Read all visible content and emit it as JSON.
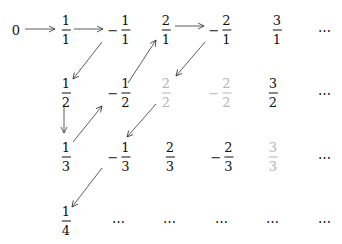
{
  "diagram": {
    "colors": {
      "text": "#111111",
      "duplicate": "#b5b5b5",
      "arrow": "#333333"
    },
    "nodes": [
      {
        "id": "zero",
        "type": "plain",
        "text": "0",
        "x": 16,
        "y": 30
      },
      {
        "id": "r0c1",
        "type": "frac",
        "sign": "",
        "num": "1",
        "den": "1",
        "x": 66,
        "y": 30,
        "gray": false
      },
      {
        "id": "r0c2",
        "type": "frac",
        "sign": "−",
        "num": "1",
        "den": "1",
        "x": 119,
        "y": 30,
        "gray": false
      },
      {
        "id": "r0c3",
        "type": "frac",
        "sign": "",
        "num": "2",
        "den": "1",
        "x": 166,
        "y": 30,
        "gray": false
      },
      {
        "id": "r0c4",
        "type": "frac",
        "sign": "−",
        "num": "2",
        "den": "1",
        "x": 220,
        "y": 30,
        "gray": false
      },
      {
        "id": "r0c5",
        "type": "frac",
        "sign": "",
        "num": "3",
        "den": "1",
        "x": 277,
        "y": 30,
        "gray": false
      },
      {
        "id": "r0c6",
        "type": "dots",
        "text": "⋯",
        "x": 325,
        "y": 30
      },
      {
        "id": "r1c1",
        "type": "frac",
        "sign": "",
        "num": "1",
        "den": "2",
        "x": 66,
        "y": 93,
        "gray": false
      },
      {
        "id": "r1c2",
        "type": "frac",
        "sign": "−",
        "num": "1",
        "den": "2",
        "x": 119,
        "y": 93,
        "gray": false
      },
      {
        "id": "r1c3",
        "type": "frac",
        "sign": "",
        "num": "2",
        "den": "2",
        "x": 166,
        "y": 93,
        "gray": true
      },
      {
        "id": "r1c4",
        "type": "frac",
        "sign": "−",
        "num": "2",
        "den": "2",
        "x": 220,
        "y": 93,
        "gray": true
      },
      {
        "id": "r1c5",
        "type": "frac",
        "sign": "",
        "num": "3",
        "den": "2",
        "x": 273,
        "y": 93,
        "gray": false
      },
      {
        "id": "r1c6",
        "type": "dots",
        "text": "⋯",
        "x": 325,
        "y": 93
      },
      {
        "id": "r2c1",
        "type": "frac",
        "sign": "",
        "num": "1",
        "den": "3",
        "x": 66,
        "y": 157,
        "gray": false
      },
      {
        "id": "r2c2",
        "type": "frac",
        "sign": "−",
        "num": "1",
        "den": "3",
        "x": 119,
        "y": 157,
        "gray": false
      },
      {
        "id": "r2c3",
        "type": "frac",
        "sign": "",
        "num": "2",
        "den": "3",
        "x": 170,
        "y": 157,
        "gray": false
      },
      {
        "id": "r2c4",
        "type": "frac",
        "sign": "−",
        "num": "2",
        "den": "3",
        "x": 222,
        "y": 157,
        "gray": false
      },
      {
        "id": "r2c5",
        "type": "frac",
        "sign": "",
        "num": "3",
        "den": "3",
        "x": 273,
        "y": 157,
        "gray": true
      },
      {
        "id": "r2c6",
        "type": "dots",
        "text": "⋯",
        "x": 325,
        "y": 157
      },
      {
        "id": "r3c1",
        "type": "frac",
        "sign": "",
        "num": "1",
        "den": "4",
        "x": 66,
        "y": 221,
        "gray": false
      },
      {
        "id": "r3c2",
        "type": "dots",
        "text": "⋯",
        "x": 119,
        "y": 221
      },
      {
        "id": "r3c3",
        "type": "dots",
        "text": "⋯",
        "x": 170,
        "y": 221
      },
      {
        "id": "r3c4",
        "type": "dots",
        "text": "⋯",
        "x": 222,
        "y": 221
      },
      {
        "id": "r3c5",
        "type": "dots",
        "text": "⋯",
        "x": 273,
        "y": 221
      },
      {
        "id": "r3c6",
        "type": "dots",
        "text": "⋯",
        "x": 325,
        "y": 221
      }
    ],
    "arrows": [
      {
        "from": "0",
        "to": "1/1",
        "x1": 25,
        "y1": 29,
        "x2": 55,
        "y2": 29
      },
      {
        "from": "1/1",
        "to": "-1/1",
        "x1": 74,
        "y1": 29,
        "x2": 103,
        "y2": 29
      },
      {
        "from": "-1/1",
        "to": "1/2",
        "x1": 102,
        "y1": 42,
        "x2": 73,
        "y2": 79
      },
      {
        "from": "1/2",
        "to": "1/3",
        "x1": 64,
        "y1": 104,
        "x2": 64,
        "y2": 133
      },
      {
        "from": "1/3",
        "to": "-1/2",
        "x1": 73,
        "y1": 142,
        "x2": 102,
        "y2": 106
      },
      {
        "from": "-1/2",
        "to": "2/1",
        "x1": 128,
        "y1": 83,
        "x2": 156,
        "y2": 40
      },
      {
        "from": "2/1",
        "to": "-2/1",
        "x1": 175,
        "y1": 26,
        "x2": 204,
        "y2": 26
      },
      {
        "from": "-2/1",
        "to": "2/2",
        "x1": 205,
        "y1": 42,
        "x2": 176,
        "y2": 76
      },
      {
        "from": "2/2",
        "to": "-1/3",
        "x1": 156,
        "y1": 104,
        "x2": 127,
        "y2": 137
      },
      {
        "from": "-1/3",
        "to": "1/4",
        "x1": 102,
        "y1": 168,
        "x2": 72,
        "y2": 207
      }
    ]
  }
}
